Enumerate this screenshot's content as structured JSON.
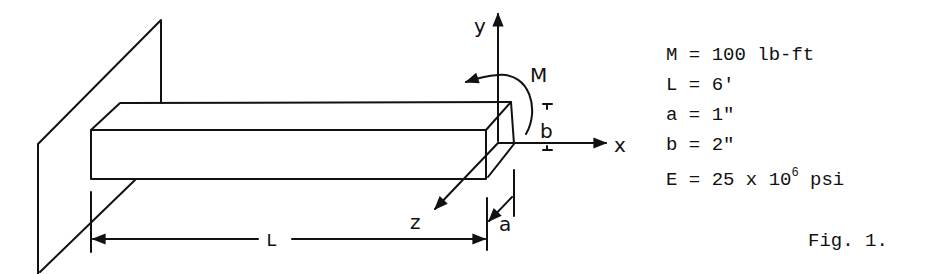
{
  "figure": {
    "caption": "Fig. 1.",
    "labels": {
      "y_axis": "y",
      "x_axis": "x",
      "z_axis": "z",
      "moment": "M",
      "length": "L",
      "depth": "b",
      "width": "a"
    },
    "parameters": [
      {
        "symbol": "M",
        "eq": " = ",
        "value": "100 lb-ft"
      },
      {
        "symbol": "L",
        "eq": " = ",
        "value": "6'"
      },
      {
        "symbol": "a",
        "eq": " = ",
        "value": "1\""
      },
      {
        "symbol": "b",
        "eq": " = ",
        "value": "2\""
      },
      {
        "symbol": "E",
        "eq": " = ",
        "value": "25 x 10",
        "exponent": "6",
        "unit": " psi"
      }
    ],
    "colors": {
      "ink": "#111111",
      "background": "#ffffff"
    }
  }
}
